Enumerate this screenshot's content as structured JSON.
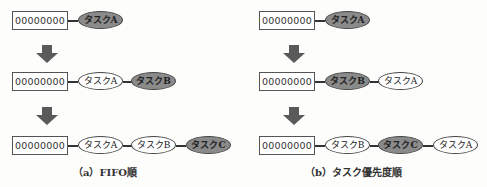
{
  "colors": {
    "highlight_task": "#8a8a8a",
    "normal_task": "#ffffff",
    "arrow": "#5a5a5a"
  },
  "panels": [
    {
      "caption": "（a）FIFO順",
      "rows": [
        {
          "queue_label": "00000000",
          "tasks": [
            {
              "label": "タスクA",
              "highlight": true
            }
          ]
        },
        {
          "queue_label": "00000000",
          "tasks": [
            {
              "label": "タスクA",
              "highlight": false
            },
            {
              "label": "タスクB",
              "highlight": true
            }
          ]
        },
        {
          "queue_label": "00000000",
          "tasks": [
            {
              "label": "タスクA",
              "highlight": false
            },
            {
              "label": "タスクB",
              "highlight": false
            },
            {
              "label": "タスクC",
              "highlight": true
            }
          ]
        }
      ]
    },
    {
      "caption": "（b）タスク優先度順",
      "rows": [
        {
          "queue_label": "00000000",
          "tasks": [
            {
              "label": "タスクA",
              "highlight": true
            }
          ]
        },
        {
          "queue_label": "00000000",
          "tasks": [
            {
              "label": "タスクB",
              "highlight": true
            },
            {
              "label": "タスクA",
              "highlight": false
            }
          ]
        },
        {
          "queue_label": "00000000",
          "tasks": [
            {
              "label": "タスクB",
              "highlight": false
            },
            {
              "label": "タスクC",
              "highlight": true
            },
            {
              "label": "タスクA",
              "highlight": false
            }
          ]
        }
      ]
    }
  ]
}
